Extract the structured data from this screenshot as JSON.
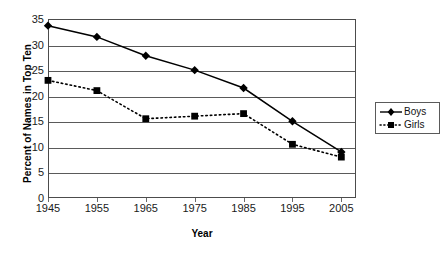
{
  "chart_data": {
    "type": "line",
    "title": "",
    "xlabel": "Year",
    "ylabel": "Percent of Names in Top Ten",
    "x": [
      1945,
      1955,
      1965,
      1975,
      1985,
      1995,
      2005
    ],
    "xticklabels": [
      "1945",
      "1955",
      "1965",
      "1975",
      "1985",
      "1995",
      "2005"
    ],
    "yticklabels": [
      "0",
      "5",
      "10",
      "15",
      "20",
      "25",
      "30",
      "35"
    ],
    "yticks": [
      0,
      5,
      10,
      15,
      20,
      25,
      30,
      35
    ],
    "xlim": [
      1945,
      2008
    ],
    "ylim": [
      0,
      35
    ],
    "grid": "horizontal",
    "legend_position": "right",
    "series": [
      {
        "name": "Boys",
        "values": [
          33.7,
          31.5,
          27.8,
          25.0,
          21.5,
          15.0,
          9.0
        ],
        "marker": "diamond",
        "linestyle": "solid",
        "color": "#000000"
      },
      {
        "name": "Girls",
        "values": [
          23.0,
          21.0,
          15.5,
          16.0,
          16.5,
          10.5,
          8.0
        ],
        "marker": "square",
        "linestyle": "dotted",
        "color": "#000000"
      }
    ]
  },
  "legend": {
    "entries": [
      {
        "label": "Boys"
      },
      {
        "label": "Girls"
      }
    ]
  },
  "colors": {
    "axis": "#4c4c4c",
    "gridline": "#5a5a5a",
    "series": "#000000",
    "background": "#ffffff"
  }
}
